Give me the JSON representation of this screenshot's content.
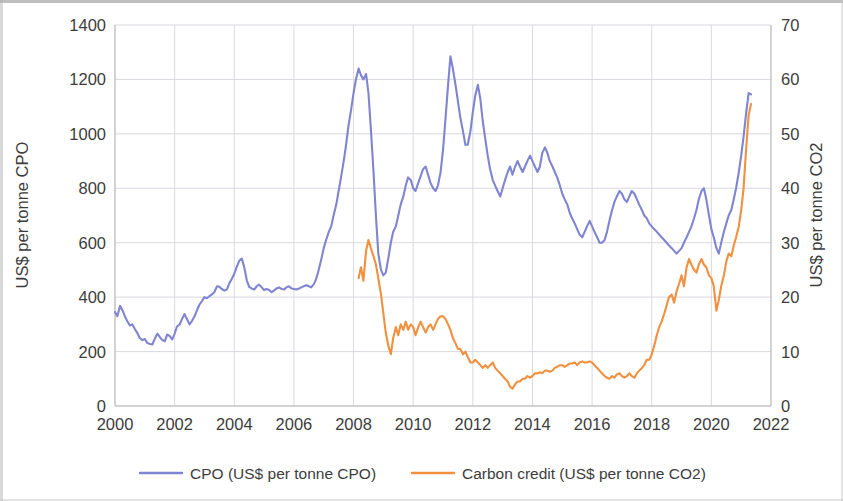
{
  "chart_data": {
    "type": "line",
    "title": "",
    "xlabel": "",
    "ylabel": "US$ per tonne CPO",
    "y2label": "US$ per tonne CO2",
    "xlim": [
      2000,
      2022
    ],
    "ylim": [
      0,
      1400
    ],
    "y2lim": [
      0,
      70
    ],
    "x_ticks": [
      "2000",
      "2002",
      "2004",
      "2006",
      "2008",
      "2010",
      "2012",
      "2014",
      "2016",
      "2018",
      "2020",
      "2022"
    ],
    "y_ticks": [
      "0",
      "200",
      "400",
      "600",
      "800",
      "1000",
      "1200",
      "1400"
    ],
    "y2_ticks": [
      "0",
      "10",
      "20",
      "30",
      "40",
      "50",
      "60",
      "70"
    ],
    "grid": true,
    "legend_position": "bottom",
    "colors": {
      "cpo": "#8085d1",
      "carbon": "#f1903f"
    },
    "series": [
      {
        "name": "CPO (US$ per tonne CPO)",
        "axis": "left",
        "color": "#8085d1",
        "x": [
          2000.0,
          2000.08,
          2000.17,
          2000.25,
          2000.33,
          2000.42,
          2000.5,
          2000.58,
          2000.67,
          2000.75,
          2000.83,
          2000.92,
          2001.0,
          2001.08,
          2001.17,
          2001.25,
          2001.33,
          2001.42,
          2001.5,
          2001.58,
          2001.67,
          2001.75,
          2001.83,
          2001.92,
          2002.0,
          2002.08,
          2002.17,
          2002.25,
          2002.33,
          2002.42,
          2002.5,
          2002.58,
          2002.67,
          2002.75,
          2002.83,
          2002.92,
          2003.0,
          2003.08,
          2003.17,
          2003.25,
          2003.33,
          2003.42,
          2003.5,
          2003.58,
          2003.67,
          2003.75,
          2003.83,
          2003.92,
          2004.0,
          2004.08,
          2004.17,
          2004.25,
          2004.33,
          2004.42,
          2004.5,
          2004.58,
          2004.67,
          2004.75,
          2004.83,
          2004.92,
          2005.0,
          2005.08,
          2005.17,
          2005.25,
          2005.33,
          2005.42,
          2005.5,
          2005.58,
          2005.67,
          2005.75,
          2005.83,
          2005.92,
          2006.0,
          2006.08,
          2006.17,
          2006.25,
          2006.33,
          2006.42,
          2006.5,
          2006.58,
          2006.67,
          2006.75,
          2006.83,
          2006.92,
          2007.0,
          2007.08,
          2007.17,
          2007.25,
          2007.33,
          2007.42,
          2007.5,
          2007.58,
          2007.67,
          2007.75,
          2007.83,
          2007.92,
          2008.0,
          2008.08,
          2008.17,
          2008.25,
          2008.33,
          2008.42,
          2008.5,
          2008.58,
          2008.67,
          2008.75,
          2008.83,
          2008.92,
          2009.0,
          2009.08,
          2009.17,
          2009.25,
          2009.33,
          2009.42,
          2009.5,
          2009.58,
          2009.67,
          2009.75,
          2009.83,
          2009.92,
          2010.0,
          2010.08,
          2010.17,
          2010.25,
          2010.33,
          2010.42,
          2010.5,
          2010.58,
          2010.67,
          2010.75,
          2010.83,
          2010.92,
          2011.0,
          2011.08,
          2011.17,
          2011.25,
          2011.33,
          2011.42,
          2011.5,
          2011.58,
          2011.67,
          2011.75,
          2011.83,
          2011.92,
          2012.0,
          2012.08,
          2012.17,
          2012.25,
          2012.33,
          2012.42,
          2012.5,
          2012.58,
          2012.67,
          2012.75,
          2012.83,
          2012.92,
          2013.0,
          2013.08,
          2013.17,
          2013.25,
          2013.33,
          2013.42,
          2013.5,
          2013.58,
          2013.67,
          2013.75,
          2013.83,
          2013.92,
          2014.0,
          2014.08,
          2014.17,
          2014.25,
          2014.33,
          2014.42,
          2014.5,
          2014.58,
          2014.67,
          2014.75,
          2014.83,
          2014.92,
          2015.0,
          2015.08,
          2015.17,
          2015.25,
          2015.33,
          2015.42,
          2015.5,
          2015.58,
          2015.67,
          2015.75,
          2015.83,
          2015.92,
          2016.0,
          2016.08,
          2016.17,
          2016.25,
          2016.33,
          2016.42,
          2016.5,
          2016.58,
          2016.67,
          2016.75,
          2016.83,
          2016.92,
          2017.0,
          2017.08,
          2017.17,
          2017.25,
          2017.33,
          2017.42,
          2017.5,
          2017.58,
          2017.67,
          2017.75,
          2017.83,
          2017.92,
          2018.0,
          2018.08,
          2018.17,
          2018.25,
          2018.33,
          2018.42,
          2018.5,
          2018.58,
          2018.67,
          2018.75,
          2018.83,
          2018.92,
          2019.0,
          2019.08,
          2019.17,
          2019.25,
          2019.33,
          2019.42,
          2019.5,
          2019.58,
          2019.67,
          2019.75,
          2019.83,
          2019.92,
          2020.0,
          2020.08,
          2020.17,
          2020.25,
          2020.33,
          2020.42,
          2020.5,
          2020.58,
          2020.67,
          2020.75,
          2020.83,
          2020.92,
          2021.0,
          2021.08,
          2021.17,
          2021.25,
          2021.33
        ],
        "values": [
          345,
          330,
          368,
          352,
          330,
          310,
          296,
          300,
          282,
          268,
          250,
          242,
          246,
          232,
          228,
          226,
          246,
          266,
          254,
          243,
          238,
          262,
          258,
          245,
          266,
          292,
          300,
          320,
          338,
          318,
          300,
          312,
          330,
          352,
          372,
          386,
          400,
          396,
          404,
          410,
          418,
          440,
          438,
          430,
          424,
          428,
          450,
          468,
          486,
          510,
          534,
          542,
          512,
          462,
          438,
          432,
          428,
          440,
          446,
          436,
          426,
          430,
          426,
          418,
          424,
          432,
          436,
          430,
          428,
          436,
          440,
          432,
          430,
          428,
          432,
          436,
          440,
          444,
          440,
          436,
          448,
          468,
          500,
          540,
          580,
          610,
          640,
          660,
          700,
          740,
          790,
          840,
          900,
          960,
          1030,
          1090,
          1150,
          1200,
          1240,
          1215,
          1200,
          1220,
          1150,
          1020,
          860,
          700,
          560,
          500,
          480,
          490,
          545,
          600,
          640,
          660,
          700,
          740,
          770,
          810,
          840,
          830,
          800,
          790,
          820,
          845,
          870,
          880,
          850,
          820,
          800,
          790,
          810,
          860,
          940,
          1050,
          1180,
          1285,
          1240,
          1180,
          1120,
          1060,
          1010,
          960,
          960,
          1010,
          1080,
          1140,
          1180,
          1130,
          1050,
          980,
          920,
          870,
          830,
          810,
          790,
          770,
          800,
          830,
          860,
          880,
          850,
          880,
          900,
          880,
          860,
          880,
          900,
          920,
          900,
          880,
          860,
          880,
          930,
          950,
          930,
          900,
          880,
          860,
          840,
          810,
          780,
          760,
          740,
          710,
          690,
          670,
          650,
          630,
          620,
          640,
          660,
          680,
          660,
          640,
          620,
          600,
          600,
          610,
          640,
          680,
          720,
          750,
          770,
          790,
          780,
          760,
          750,
          770,
          790,
          780,
          760,
          740,
          720,
          700,
          690,
          670,
          660,
          650,
          640,
          630,
          620,
          610,
          600,
          590,
          580,
          570,
          560,
          570,
          580,
          600,
          620,
          640,
          660,
          690,
          720,
          760,
          790,
          800,
          760,
          700,
          650,
          620,
          580,
          560,
          600,
          640,
          670,
          700,
          720,
          760,
          800,
          860,
          920,
          990,
          1080,
          1150,
          1145
        ]
      },
      {
        "name": "Carbon credit (US$ per tonne CO2)",
        "axis": "right",
        "color": "#f1903f",
        "x": [
          2008.17,
          2008.25,
          2008.33,
          2008.42,
          2008.5,
          2008.58,
          2008.67,
          2008.75,
          2008.83,
          2008.92,
          2009.0,
          2009.08,
          2009.17,
          2009.25,
          2009.33,
          2009.42,
          2009.5,
          2009.58,
          2009.67,
          2009.75,
          2009.83,
          2009.92,
          2010.0,
          2010.08,
          2010.17,
          2010.25,
          2010.33,
          2010.42,
          2010.5,
          2010.58,
          2010.67,
          2010.75,
          2010.83,
          2010.92,
          2011.0,
          2011.08,
          2011.17,
          2011.25,
          2011.33,
          2011.42,
          2011.5,
          2011.58,
          2011.67,
          2011.75,
          2011.83,
          2011.92,
          2012.0,
          2012.08,
          2012.17,
          2012.25,
          2012.33,
          2012.42,
          2012.5,
          2012.58,
          2012.67,
          2012.75,
          2012.83,
          2012.92,
          2013.0,
          2013.08,
          2013.17,
          2013.25,
          2013.33,
          2013.42,
          2013.5,
          2013.58,
          2013.67,
          2013.75,
          2013.83,
          2013.92,
          2014.0,
          2014.08,
          2014.17,
          2014.25,
          2014.33,
          2014.42,
          2014.5,
          2014.58,
          2014.67,
          2014.75,
          2014.83,
          2014.92,
          2015.0,
          2015.08,
          2015.17,
          2015.25,
          2015.33,
          2015.42,
          2015.5,
          2015.58,
          2015.67,
          2015.75,
          2015.83,
          2015.92,
          2016.0,
          2016.08,
          2016.17,
          2016.25,
          2016.33,
          2016.42,
          2016.5,
          2016.58,
          2016.67,
          2016.75,
          2016.83,
          2016.92,
          2017.0,
          2017.08,
          2017.17,
          2017.25,
          2017.33,
          2017.42,
          2017.5,
          2017.58,
          2017.67,
          2017.75,
          2017.83,
          2017.92,
          2018.0,
          2018.08,
          2018.17,
          2018.25,
          2018.33,
          2018.42,
          2018.5,
          2018.58,
          2018.67,
          2018.75,
          2018.83,
          2018.92,
          2019.0,
          2019.08,
          2019.17,
          2019.25,
          2019.33,
          2019.42,
          2019.5,
          2019.58,
          2019.67,
          2019.75,
          2019.83,
          2019.92,
          2020.0,
          2020.08,
          2020.17,
          2020.25,
          2020.33,
          2020.42,
          2020.5,
          2020.58,
          2020.67,
          2020.75,
          2020.83,
          2020.92,
          2021.0,
          2021.08,
          2021.17,
          2021.25,
          2021.33
        ],
        "values": [
          23.5,
          25.5,
          23.0,
          28.5,
          30.5,
          29.0,
          27.5,
          26.0,
          23.5,
          20.5,
          17.0,
          13.5,
          11.0,
          9.5,
          12.5,
          14.5,
          13.0,
          15.0,
          14.0,
          15.5,
          14.0,
          15.0,
          14.5,
          13.0,
          14.5,
          15.5,
          14.5,
          13.5,
          14.5,
          15.0,
          14.0,
          15.0,
          16.0,
          16.5,
          16.5,
          16.0,
          15.0,
          14.0,
          12.5,
          11.5,
          10.5,
          10.5,
          9.5,
          10.0,
          9.0,
          8.0,
          8.0,
          8.5,
          8.0,
          7.5,
          7.0,
          7.5,
          7.0,
          7.5,
          8.0,
          7.0,
          6.5,
          6.0,
          5.5,
          5.0,
          4.5,
          3.5,
          3.2,
          4.0,
          4.5,
          4.5,
          5.0,
          5.0,
          5.5,
          5.2,
          5.5,
          6.0,
          6.0,
          6.2,
          6.0,
          6.5,
          6.5,
          6.3,
          6.5,
          7.0,
          7.2,
          7.5,
          7.5,
          7.2,
          7.5,
          7.8,
          7.8,
          8.0,
          7.5,
          8.0,
          8.2,
          8.0,
          8.0,
          8.2,
          8.0,
          7.5,
          7.0,
          6.5,
          6.0,
          5.5,
          5.2,
          5.0,
          5.5,
          5.2,
          5.8,
          6.0,
          5.5,
          5.2,
          5.5,
          6.0,
          5.5,
          5.2,
          6.0,
          6.5,
          7.0,
          7.5,
          8.5,
          8.5,
          9.5,
          11.0,
          13.0,
          14.5,
          15.5,
          17.0,
          18.5,
          20.0,
          20.5,
          19.0,
          21.0,
          22.5,
          24.0,
          22.0,
          25.5,
          27.0,
          26.0,
          25.0,
          24.5,
          26.0,
          27.0,
          26.0,
          25.5,
          24.0,
          23.5,
          22.0,
          17.5,
          19.5,
          22.0,
          24.0,
          26.5,
          28.0,
          27.5,
          29.5,
          31.0,
          33.0,
          36.0,
          40.0,
          47.5,
          53.5,
          55.5
        ]
      }
    ]
  },
  "legend": {
    "items": [
      {
        "label": "CPO (US$ per tonne CPO)",
        "color": "#8085d1"
      },
      {
        "label": "Carbon credit (US$ per tonne CO2)",
        "color": "#f1903f"
      }
    ]
  },
  "axes": {
    "left_title": "US$ per tonne CPO",
    "right_title": "US$ per tonne CO2"
  }
}
